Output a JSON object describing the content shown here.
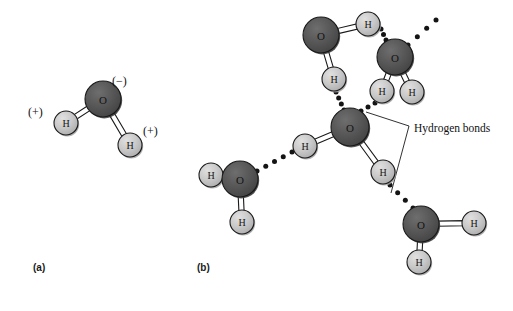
{
  "figure": {
    "background_color": "#ffffff",
    "width": 513,
    "height": 311
  },
  "colors": {
    "oxygen_fill": "#555555",
    "oxygen_shadow": "#3d3d3d",
    "oxygen_highlight": "#6b6b6b",
    "hydrogen_fill": "#c9c9c9",
    "hydrogen_shadow": "#a8a8a8",
    "hydrogen_highlight": "#dcdcdc",
    "outline": "#1a1a1a",
    "bond_fill": "#ffffff",
    "hbond_dot": "#141414",
    "text": "#141414"
  },
  "atom_labels": {
    "oxygen": "O",
    "hydrogen": "H"
  },
  "panels": [
    {
      "id": "a",
      "label": "(a)",
      "label_x": 33,
      "label_y": 262,
      "caption_hidden": "Single polar water molecule with partial charges"
    },
    {
      "id": "b",
      "label": "(b)",
      "label_x": 197,
      "label_y": 262,
      "caption_hidden": "Network of water molecules joined by hydrogen bonds"
    }
  ],
  "panel_a": {
    "charges": [
      {
        "name": "oxygen-negative-charge",
        "text": "(−)",
        "x": 112,
        "y": 74
      },
      {
        "name": "hydrogen-left-positive-charge",
        "text": "(+)",
        "x": 28,
        "y": 105
      },
      {
        "name": "hydrogen-right-positive-charge",
        "text": "(+)",
        "x": 143,
        "y": 124
      }
    ],
    "molecule": {
      "name": "water-molecule-polar",
      "oxygen": {
        "cx": 103,
        "cy": 99,
        "r": 18
      },
      "hydrogens": [
        {
          "name": "hydrogen-left",
          "cx": 66,
          "cy": 123,
          "r": 12
        },
        {
          "name": "hydrogen-right",
          "cx": 130,
          "cy": 145,
          "r": 12
        }
      ]
    }
  },
  "panel_b": {
    "callout": {
      "name": "hydrogen-bonds-callout",
      "text": "Hydrogen bonds",
      "x": 414,
      "y": 122
    },
    "molecules": [
      {
        "name": "water-molecule-top-left",
        "oxygen": {
          "cx": 321,
          "cy": 35,
          "r": 18
        },
        "hydrogens": [
          {
            "name": "hydrogen-upper-right",
            "cx": 368,
            "cy": 24,
            "r": 12
          },
          {
            "name": "hydrogen-lower",
            "cx": 334,
            "cy": 79,
            "r": 12
          }
        ]
      },
      {
        "name": "water-molecule-top-right",
        "oxygen": {
          "cx": 395,
          "cy": 57,
          "r": 18
        },
        "hydrogens": [
          {
            "name": "hydrogen-lower-left",
            "cx": 382,
            "cy": 91,
            "r": 12
          },
          {
            "name": "hydrogen-lower-right",
            "cx": 412,
            "cy": 92,
            "r": 12
          }
        ]
      },
      {
        "name": "water-molecule-center",
        "oxygen": {
          "cx": 350,
          "cy": 127,
          "r": 19
        },
        "hydrogens": [
          {
            "name": "hydrogen-left",
            "cx": 305,
            "cy": 146,
            "r": 12
          },
          {
            "name": "hydrogen-lower-right",
            "cx": 383,
            "cy": 172,
            "r": 12
          }
        ]
      },
      {
        "name": "water-molecule-left",
        "oxygen": {
          "cx": 240,
          "cy": 179,
          "r": 18
        },
        "hydrogens": [
          {
            "name": "hydrogen-left",
            "cx": 211,
            "cy": 175,
            "r": 12
          },
          {
            "name": "hydrogen-lower",
            "cx": 242,
            "cy": 222,
            "r": 12
          }
        ]
      },
      {
        "name": "water-molecule-bottom-right",
        "oxygen": {
          "cx": 421,
          "cy": 224,
          "r": 18
        },
        "hydrogens": [
          {
            "name": "hydrogen-right",
            "cx": 474,
            "cy": 223,
            "r": 12
          },
          {
            "name": "hydrogen-lower-left",
            "cx": 419,
            "cy": 262,
            "r": 12
          }
        ]
      }
    ],
    "hydrogen_bonds": [
      {
        "name": "hbond-topleft-h-to-center-o",
        "from": "water-molecule-top-left.hydrogen-lower",
        "to": "water-molecule-center.oxygen",
        "x1": 336,
        "y1": 92,
        "x2": 344,
        "y2": 110,
        "dots": 4
      },
      {
        "name": "hbond-topright-h-to-center-o",
        "from": "water-molecule-top-right.hydrogen-lower-left",
        "to": "water-molecule-center.oxygen",
        "x1": 375,
        "y1": 103,
        "x2": 361,
        "y2": 111,
        "dots": 3
      },
      {
        "name": "hbond-topleft-h-to-topright-o",
        "from": "water-molecule-top-left.hydrogen-upper-right",
        "to": "water-molecule-top-right.oxygen",
        "x1": 381,
        "y1": 29,
        "x2": 386,
        "y2": 40,
        "dots": 3
      },
      {
        "name": "hbond-topright-o-to-upper-right",
        "from": "water-molecule-top-right.oxygen",
        "to": "off-figure-upper-right",
        "x1": 408,
        "y1": 45,
        "x2": 436,
        "y2": 20,
        "dots": 4
      },
      {
        "name": "hbond-center-h-to-left-o",
        "from": "water-molecule-center.hydrogen-left",
        "to": "water-molecule-left.oxygen",
        "x1": 292,
        "y1": 152,
        "x2": 257,
        "y2": 171,
        "dots": 5
      },
      {
        "name": "hbond-center-h-to-bottomright-o",
        "from": "water-molecule-center.hydrogen-lower-right",
        "to": "water-molecule-bottom-right.oxygen",
        "x1": 390,
        "y1": 185,
        "x2": 413,
        "y2": 208,
        "dots": 4
      }
    ],
    "leader_lines": [
      {
        "name": "leader-line-upper",
        "x1": 366,
        "y1": 112,
        "x2": 409,
        "y2": 126
      },
      {
        "name": "leader-line-lower",
        "x1": 409,
        "y1": 126,
        "x2": 391,
        "y2": 193
      }
    ]
  }
}
